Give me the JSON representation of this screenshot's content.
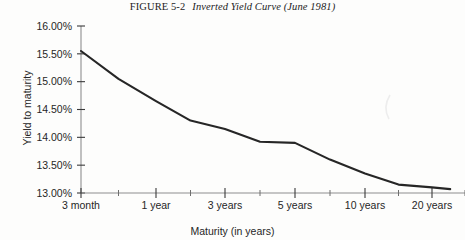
{
  "figure": {
    "number": "FIGURE 5-2",
    "caption": "Inverted Yield Curve (June 1981)"
  },
  "axes": {
    "y_title": "Yield to maturity",
    "x_title": "Maturity (in years)"
  },
  "chart_data": {
    "type": "line",
    "title": "Inverted Yield Curve (June 1981)",
    "xlabel": "Maturity (in years)",
    "ylabel": "Yield to maturity",
    "categories": [
      "3 month",
      "1 year",
      "3 years",
      "5 years",
      "10 years",
      "20 years"
    ],
    "x_tick_labels": [
      "3 month",
      "1 year",
      "3 years",
      "5 years",
      "10 years",
      "20 years"
    ],
    "y_tick_labels": [
      "16.00%",
      "15.50%",
      "15.00%",
      "14.50%",
      "14.00%",
      "13.50%",
      "13.00%"
    ],
    "y_tick_values": [
      16.0,
      15.5,
      15.0,
      14.5,
      14.0,
      13.5,
      13.0
    ],
    "ylim": [
      13.0,
      16.0
    ],
    "y_unit": "%",
    "grid": false,
    "legend": null,
    "minor_ticks": true,
    "series": [
      {
        "name": "Treasury yield curve, June 1981",
        "values": [
          15.55,
          14.65,
          14.15,
          13.9,
          13.35,
          13.1
        ],
        "points": [
          {
            "x": "3 month",
            "y": 15.55
          },
          {
            "x": "6 month",
            "y": 15.05
          },
          {
            "x": "1 year",
            "y": 14.65
          },
          {
            "x": "2 years",
            "y": 14.3
          },
          {
            "x": "3 years",
            "y": 14.15
          },
          {
            "x": "4 years",
            "y": 13.92
          },
          {
            "x": "5 years",
            "y": 13.9
          },
          {
            "x": "7 years",
            "y": 13.6
          },
          {
            "x": "10 years",
            "y": 13.35
          },
          {
            "x": "15 years",
            "y": 13.15
          },
          {
            "x": "20 years",
            "y": 13.1
          },
          {
            "x": "30 years",
            "y": 13.07
          }
        ]
      }
    ]
  },
  "colors": {
    "curve": "#262626",
    "axis": "#8e8e8e",
    "tick": "#3a3a3a",
    "text": "#262626",
    "paper": "#fdfdfc"
  }
}
